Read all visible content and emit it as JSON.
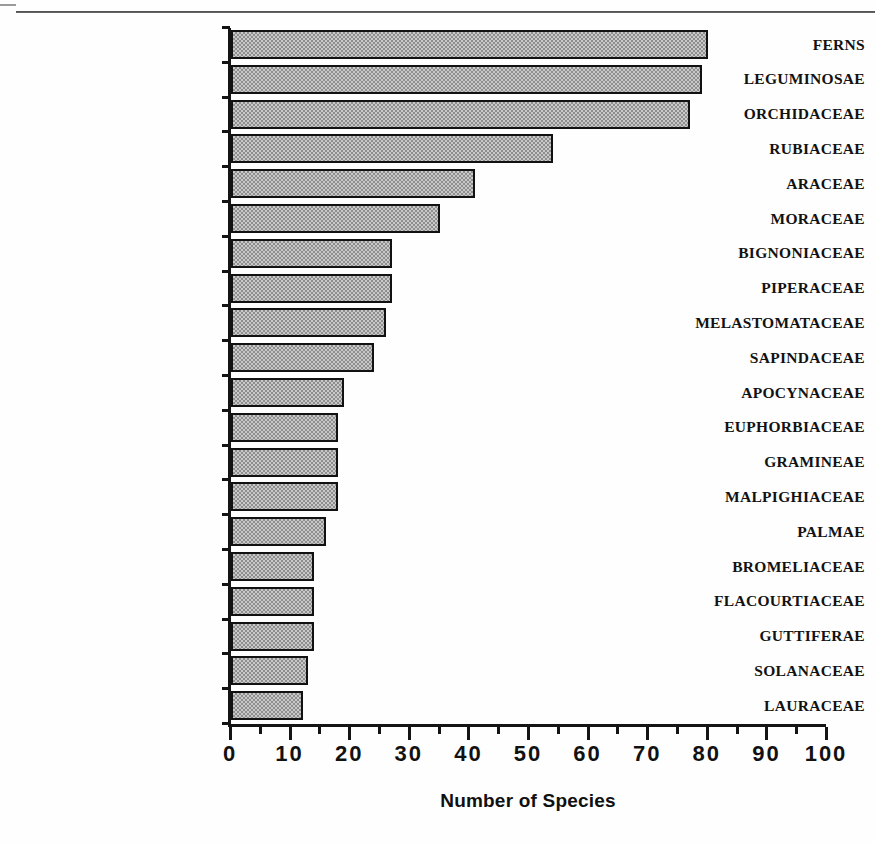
{
  "chart_data": {
    "type": "bar",
    "orientation": "horizontal",
    "title": "",
    "xlabel": "Number of Species",
    "ylabel": "",
    "xlim": [
      0,
      100
    ],
    "grid": false,
    "legend": null,
    "x_ticks": [
      0,
      10,
      20,
      30,
      40,
      50,
      60,
      70,
      80,
      90,
      100
    ],
    "x_tick_labels": [
      "0",
      "10",
      "20",
      "30",
      "40",
      "50",
      "60",
      "70",
      "80",
      "90",
      "100"
    ],
    "x_minor_tick_interval": 5,
    "categories": [
      "FERNS",
      "LEGUMINOSAE",
      "ORCHIDACEAE",
      "RUBIACEAE",
      "ARACEAE",
      "MORACEAE",
      "BIGNONIACEAE",
      "PIPERACEAE",
      "MELASTOMATACEAE",
      "SAPINDACEAE",
      "APOCYNACEAE",
      "EUPHORBIACEAE",
      "GRAMINEAE",
      "MALPIGHIACEAE",
      "PALMAE",
      "BROMELIACEAE",
      "FLACOURTIACEAE",
      "GUTTIFERAE",
      "SOLANACEAE",
      "LAURACEAE"
    ],
    "values": [
      80,
      79,
      77,
      54,
      41,
      35,
      27,
      27,
      26,
      24,
      19,
      18,
      18,
      18,
      16,
      14,
      14,
      14,
      13,
      12
    ],
    "bar_fill_color": "#a8a8a8",
    "bar_edge_color": "#111111",
    "axis_color": "#141414"
  },
  "figure": {
    "background_color": "#fefefe"
  }
}
